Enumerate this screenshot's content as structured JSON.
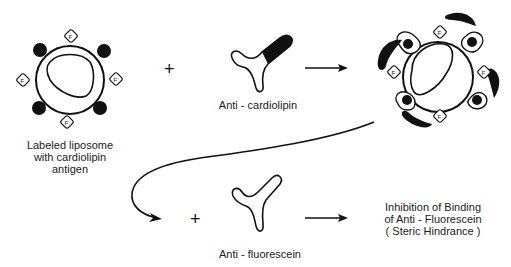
{
  "diagram": {
    "labels": {
      "liposome": [
        "Labeled  liposome",
        "with  cardiolipin",
        "antigen"
      ],
      "anti_cardiolipin": "Anti - cardiolipin",
      "anti_fluorescein": "Anti - fluorescein",
      "result": [
        "Inhibition  of  Binding",
        "of  Anti - Fluorescein",
        "( Steric  Hindrance )"
      ]
    },
    "symbols": {
      "plus": "+",
      "fluorescein_marker": "F"
    },
    "icons": {
      "liposome": "liposome-icon",
      "antibody": "antibody-icon",
      "arrow": "arrow-right-icon",
      "curved_arrow": "curved-arrow-icon"
    },
    "colors": {
      "ink": "#111111",
      "background": "#ffffff"
    }
  }
}
